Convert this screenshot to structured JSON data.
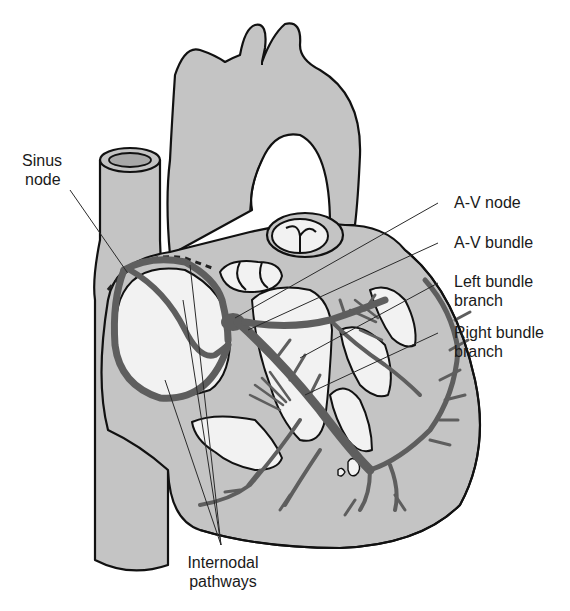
{
  "figure": {
    "colors": {
      "background": "#ffffff",
      "tissue": "#c4c4c4",
      "cavity": "#f2f2f2",
      "conduction_pathway": "#5e5e5e",
      "outline": "#111111",
      "label_text": "#1a1a1a"
    }
  },
  "labels": {
    "sinus_node": {
      "line1": "Sinus",
      "line2": "node"
    },
    "av_node": {
      "line1": "A-V node"
    },
    "av_bundle": {
      "line1": "A-V bundle"
    },
    "left_bundle_branch": {
      "line1": "Left bundle",
      "line2": "branch"
    },
    "right_bundle_branch": {
      "line1": "Right bundle",
      "line2": "branch"
    },
    "internodal_pathways": {
      "line1": "Internodal",
      "line2": "pathways"
    }
  }
}
